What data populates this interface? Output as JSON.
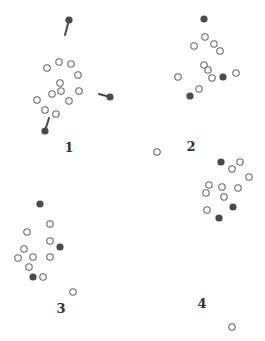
{
  "colors": {
    "filled": "#4a4a4a",
    "open_stroke": "#6a6a6a",
    "background": "#ffffff"
  },
  "panels": [
    {
      "label": "1",
      "label_pos": [
        69,
        152
      ],
      "open": [
        [
          47,
          68
        ],
        [
          59,
          62
        ],
        [
          71,
          64
        ],
        [
          78,
          75
        ],
        [
          60,
          83
        ],
        [
          52,
          94
        ],
        [
          61,
          91
        ],
        [
          79,
          91
        ],
        [
          37,
          100
        ],
        [
          69,
          101
        ],
        [
          45,
          110
        ],
        [
          56,
          114
        ]
      ],
      "filled": [
        {
          "pos": [
            69,
            20
          ],
          "tail": [
            65,
            35
          ]
        },
        {
          "pos": [
            110,
            97
          ],
          "tail": [
            99,
            94
          ]
        },
        {
          "pos": [
            45,
            131
          ],
          "tail": [
            49,
            118
          ]
        }
      ]
    },
    {
      "label": "2",
      "label_pos": [
        191,
        151
      ],
      "open": [
        [
          205,
          37
        ],
        [
          194,
          46
        ],
        [
          214,
          44
        ],
        [
          220,
          51
        ],
        [
          204,
          65
        ],
        [
          208,
          70
        ],
        [
          212,
          78
        ],
        [
          178,
          77
        ],
        [
          236,
          73
        ],
        [
          199,
          89
        ]
      ],
      "filled": [
        {
          "pos": [
            204,
            19
          ]
        },
        {
          "pos": [
            223,
            77
          ]
        },
        {
          "pos": [
            190,
            96
          ]
        }
      ]
    },
    {
      "label": "3",
      "label_pos": [
        61,
        313
      ],
      "open": [
        [
          50,
          224
        ],
        [
          27,
          232
        ],
        [
          50,
          241
        ],
        [
          24,
          249
        ],
        [
          18,
          258
        ],
        [
          33,
          257
        ],
        [
          50,
          257
        ],
        [
          29,
          267
        ],
        [
          43,
          277
        ],
        [
          73,
          292
        ]
      ],
      "filled": [
        {
          "pos": [
            40,
            204
          ]
        },
        {
          "pos": [
            60,
            247
          ]
        },
        {
          "pos": [
            33,
            277
          ]
        }
      ]
    },
    {
      "label": "4",
      "label_pos": [
        202,
        308
      ],
      "open": [
        [
          240,
          162
        ],
        [
          232,
          169
        ],
        [
          249,
          177
        ],
        [
          209,
          185
        ],
        [
          222,
          187
        ],
        [
          238,
          188
        ],
        [
          206,
          193
        ],
        [
          224,
          197
        ],
        [
          207,
          210
        ],
        [
          232,
          327
        ]
      ],
      "filled": [
        {
          "pos": [
            221,
            162
          ]
        },
        {
          "pos": [
            233,
            207
          ]
        },
        {
          "pos": [
            219,
            218
          ]
        }
      ]
    }
  ],
  "stray_points": [
    [
      157,
      152
    ]
  ]
}
